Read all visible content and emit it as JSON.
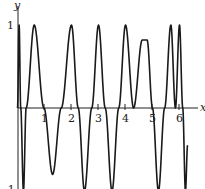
{
  "chart_data": {
    "type": "line",
    "title": "",
    "xlabel": "x",
    "ylabel": "y",
    "xlim": [
      -0.05,
      6.6
    ],
    "ylim": [
      -1,
      1
    ],
    "grid": false,
    "legend": null,
    "x_ticks": [
      "1",
      "2",
      "3",
      "4",
      "5",
      "6"
    ],
    "y_ticks": [
      "1",
      "-1"
    ],
    "series": [
      {
        "name": "y",
        "x": [
          0.0,
          0.06,
          0.12,
          0.22,
          0.32,
          0.62,
          0.98,
          1.3,
          1.62,
          2.0,
          2.25,
          2.48,
          2.75,
          3.0,
          3.25,
          3.5,
          3.75,
          4.0,
          4.3,
          4.62,
          4.8,
          5.0,
          5.22,
          5.45,
          5.68,
          5.85,
          6.0,
          6.12,
          6.22,
          6.3
        ],
        "y": [
          0.0,
          1.0,
          0.0,
          -1.0,
          0.0,
          1.0,
          0.0,
          -0.8,
          0.0,
          1.0,
          0.0,
          -1.0,
          0.0,
          1.0,
          0.0,
          -1.0,
          0.0,
          1.0,
          0.0,
          0.82,
          0.82,
          0.0,
          -1.0,
          0.0,
          1.0,
          0.0,
          1.0,
          0.0,
          -1.0,
          -0.45
        ]
      }
    ]
  },
  "labels": {
    "y_axis": "y",
    "x_axis": "x",
    "y_tick_pos": "1",
    "y_tick_neg": "-1",
    "x_ticks": [
      "1",
      "2",
      "3",
      "4",
      "5",
      "6"
    ]
  }
}
